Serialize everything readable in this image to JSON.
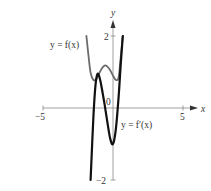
{
  "chart_data": {
    "type": "line",
    "title": "",
    "xlabel": "x",
    "ylabel": "y",
    "xlim": [
      -5,
      5.5
    ],
    "ylim": [
      -2,
      2.3
    ],
    "x_ticks": [
      {
        "value": -5,
        "label": "−5"
      },
      {
        "value": 5,
        "label": "5"
      }
    ],
    "y_ticks": [
      {
        "value": 2,
        "label": "2"
      },
      {
        "value": -2,
        "label": "−2"
      }
    ],
    "origin_label": "0",
    "grid": false,
    "series": [
      {
        "name": "y = f(x)",
        "label": "y = f(x)",
        "color": "#6b6b6b",
        "x": [
          -1.9,
          -1.75,
          -1.6,
          -1.4,
          -1.2,
          -1.0,
          -0.8,
          -0.6,
          -0.4,
          -0.2,
          0.0,
          0.2,
          0.4,
          0.55,
          0.7
        ],
        "y": [
          2.0,
          1.45,
          0.98,
          0.78,
          0.8,
          0.95,
          1.1,
          1.18,
          1.15,
          1.05,
          0.9,
          0.78,
          0.85,
          1.4,
          2.0
        ]
      },
      {
        "name": "y = f'(x)",
        "label": "y = f′(x)",
        "color": "#111111",
        "x": [
          -1.6,
          -1.5,
          -1.4,
          -1.3,
          -1.2,
          -1.1,
          -1.0,
          -0.9,
          -0.8,
          -0.6,
          -0.4,
          -0.2,
          0.0,
          0.2,
          0.4,
          0.55,
          0.7
        ],
        "y": [
          -2.0,
          -1.1,
          -0.25,
          0.4,
          0.8,
          0.95,
          0.9,
          0.75,
          0.55,
          0.1,
          -0.4,
          -0.85,
          -1.0,
          -0.6,
          0.3,
          1.2,
          2.0
        ]
      }
    ],
    "annotations": [
      {
        "text": "y = f(x)",
        "near_series": "y = f(x)",
        "position": "left"
      },
      {
        "text": "y = f′(x)",
        "near_series": "y = f'(x)",
        "position": "right-below"
      }
    ]
  }
}
